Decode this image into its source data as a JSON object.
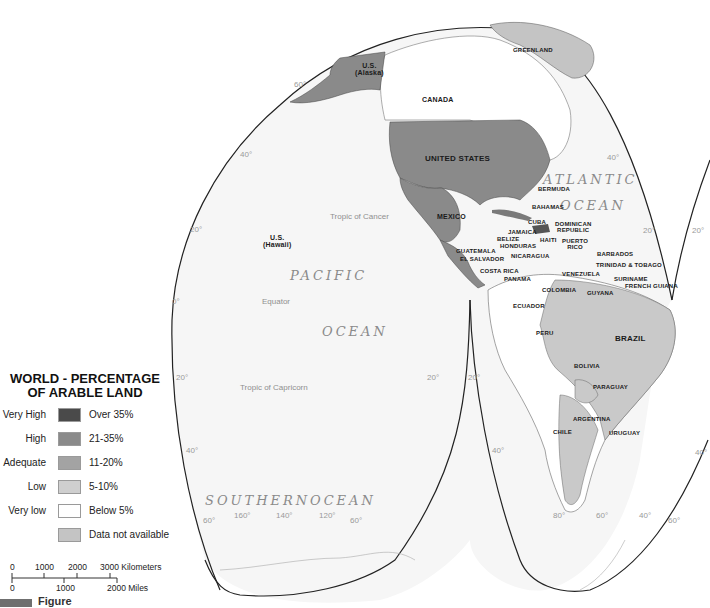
{
  "legend": {
    "title_line1": "WORLD - PERCENTAGE",
    "title_line2": "OF ARABLE LAND",
    "items": [
      {
        "level": "Very High",
        "range": "Over 35%",
        "color": "#4a4a4a"
      },
      {
        "level": "High",
        "range": "21-35%",
        "color": "#8a8a8a"
      },
      {
        "level": "Adequate",
        "range": "11-20%",
        "color": "#a3a3a3"
      },
      {
        "level": "Low",
        "range": "5-10%",
        "color": "#cfcfcf"
      },
      {
        "level": "Very low",
        "range": "Below 5%",
        "color": "#ffffff"
      },
      {
        "level": "",
        "range": "Data not available",
        "color": "#c4c4c4"
      }
    ]
  },
  "scale_bar": {
    "km_ticks": [
      "0",
      "1000",
      "2000",
      "3000 Kilometers"
    ],
    "mile_ticks": [
      "0",
      "1000",
      "2000 Miles"
    ]
  },
  "figure_label": "Figure 1.4",
  "oceans": {
    "atlantic_1": "ATLANTIC",
    "atlantic_2": "OCEAN",
    "pacific_1": "PACIFIC",
    "pacific_2": "OCEAN",
    "southern_1": "SOUTHERN",
    "southern_2": "OCEAN"
  },
  "reference_lines": {
    "tropic_cancer": "Tropic of Cancer",
    "equator": "Equator",
    "tropic_capricorn": "Tropic of Capricorn"
  },
  "countries": {
    "alaska_1": "U.S.",
    "alaska_2": "(Alaska)",
    "hawaii_1": "U.S.",
    "hawaii_2": "(Hawaii)",
    "greenland": "GREENLAND",
    "canada": "CANADA",
    "united_states": "UNITED STATES",
    "mexico": "MEXICO",
    "bermuda": "BERMUDA",
    "bahamas": "BAHAMAS",
    "cuba": "CUBA",
    "dominican_1": "DOMINICAN",
    "dominican_2": "REPUBLIC",
    "jamaica": "JAMAICA",
    "haiti": "HAITI",
    "puerto_rico_1": "PUERTO",
    "puerto_rico_2": "RICO",
    "belize": "BELIZE",
    "honduras": "HONDURAS",
    "guatemala": "GUATEMALA",
    "el_salvador": "EL SALVADOR",
    "nicaragua": "NICARAGUA",
    "costa_rica": "COSTA RICA",
    "panama": "PANAMA",
    "barbados": "BARBADOS",
    "trinidad": "TRINIDAD & TOBAGO",
    "venezuela": "VENEZUELA",
    "suriname": "SURINAME",
    "french_guiana": "FRENCH GUIANA",
    "guyana": "GUYANA",
    "colombia": "COLOMBIA",
    "ecuador": "ECUADOR",
    "peru": "PERU",
    "brazil": "BRAZIL",
    "bolivia": "BOLIVIA",
    "paraguay": "PARAGUAY",
    "argentina": "ARGENTINA",
    "chile": "CHILE",
    "uruguay": "URUGUAY"
  },
  "graticule": {
    "lat_60_alaska": "60°",
    "lat_40_nw": "40°",
    "lat_20_w": "20°",
    "lat_0_w": "0°",
    "lat_20_sw": "20°",
    "lat_40_sw": "40°",
    "lat_60_sw": "60°",
    "lon_160": "160°",
    "lon_140": "140°",
    "lon_120": "120°",
    "lat_60_pac_s": "60°",
    "lat_20_pac_se": "20°",
    "lat_20_sa_w": "20°",
    "lat_40_sa_w": "40°",
    "lon_80": "80°",
    "lon_60": "60°",
    "lon_40": "40°",
    "lat_60_sa_e": "60°",
    "lat_40_sa_e": "40°",
    "lat_40_atl": "40°",
    "lat_20_atl": "20°",
    "lat_20_e_edge": "20°",
    "lat_40_e_edge": "40°",
    "lat_60_e_edge": "60°"
  }
}
